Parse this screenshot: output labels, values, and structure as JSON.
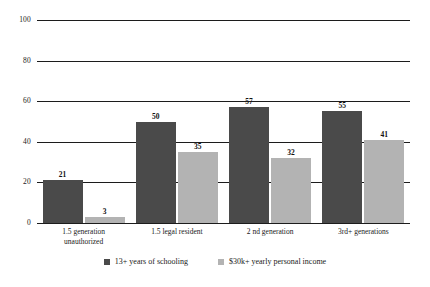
{
  "chart_data": {
    "type": "bar",
    "title": "",
    "subtitle": "",
    "xlabel": "",
    "ylabel": "",
    "ylim": [
      0,
      100
    ],
    "yticks": [
      0,
      20,
      40,
      60,
      80,
      100
    ],
    "grid": true,
    "legend_position": "bottom-center",
    "categories": [
      "1.5 generation\nunauthorized",
      "1.5 legal resident",
      "2 nd generation",
      "3rd+ generations"
    ],
    "series": [
      {
        "name": "13+ years of schooling",
        "color": "#4a4a4a",
        "values": [
          21,
          50,
          57,
          55
        ]
      },
      {
        "name": "$30k+ yearly personal income",
        "color": "#b3b3b3",
        "values": [
          3,
          35,
          32,
          41
        ]
      }
    ]
  },
  "axis": {
    "y_tick_labels": [
      "100",
      "80",
      "60",
      "40",
      "20",
      "0"
    ]
  },
  "legend": {
    "items": [
      {
        "label": "13+ years of schooling",
        "color": "#4a4a4a"
      },
      {
        "label": "$30k+ yearly personal income",
        "color": "#b3b3b3"
      }
    ]
  },
  "colors": {
    "series_dark": "#4a4a4a",
    "series_light": "#b3b3b3",
    "gridline": "#1c1c1c",
    "background": "#ffffff",
    "text": "#1a1a1a"
  }
}
